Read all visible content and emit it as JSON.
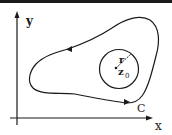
{
  "diagram": {
    "type": "complex-plane contour diagram",
    "axes": {
      "x_label": "x",
      "y_label": "y"
    },
    "contour": {
      "label": "C",
      "orientation": "counterclockwise"
    },
    "circle": {
      "radius_label": "r",
      "center_label": "z",
      "center_subscript": "0"
    },
    "colors": {
      "ink": "#1a1a1a",
      "background": "#ffffff"
    }
  }
}
